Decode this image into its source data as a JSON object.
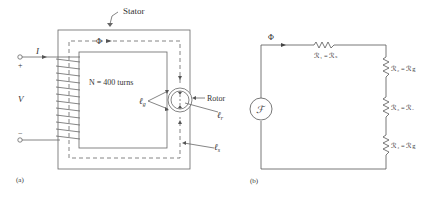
{
  "figure_a": {
    "caption": "(a)",
    "stator_label": "Stator",
    "rotor_label": "Rotor",
    "flux_symbol": "Φ",
    "current_symbol": "I",
    "voltage_symbol": "V",
    "plus_sign": "+",
    "minus_sign": "−",
    "turns_label": "N = 400 turns",
    "gap_label": "ℓ",
    "gap_subscript": "g",
    "rotor_len_label": "ℓ",
    "rotor_len_subscript": "r",
    "stator_len_label": "ℓ",
    "stator_len_subscript": "s"
  },
  "figure_b": {
    "caption": "(b)",
    "flux_symbol": "Φ",
    "source_symbol": "ℱ",
    "resistors": [
      {
        "name": "R1",
        "label": "ℛ₁ = ℛₛ"
      },
      {
        "name": "R2",
        "label": "ℛ₂ = ℛg"
      },
      {
        "name": "R3",
        "label": "ℛ₃ = ℛᵣ"
      },
      {
        "name": "R4",
        "label": "ℛ₄ = ℛg"
      }
    ]
  },
  "colors": {
    "line": "#555555",
    "text": "#333333",
    "background": "#ffffff"
  }
}
